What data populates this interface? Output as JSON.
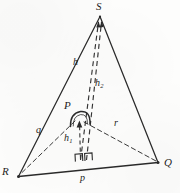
{
  "figure": {
    "stroke_color": "#2b2b2b",
    "dash_color": "#3a3a3a",
    "background_color": "#fdfdfc"
  },
  "vertices": [
    {
      "id": "S",
      "label": "S",
      "x": 100,
      "y": 16,
      "label_x": 98,
      "label_y": 2
    },
    {
      "id": "R",
      "label": "R",
      "x": 18,
      "y": 176,
      "label_x": 4,
      "label_y": 168
    },
    {
      "id": "Q",
      "label": "Q",
      "x": 158,
      "y": 162,
      "label_x": 164,
      "label_y": 160
    },
    {
      "id": "P",
      "label": "P",
      "x": 78,
      "y": 119,
      "label_x": 66,
      "label_y": 101
    }
  ],
  "sides": [
    {
      "id": "RS",
      "from": "R",
      "to": "S",
      "style": "solid"
    },
    {
      "id": "SQ",
      "from": "S",
      "to": "Q",
      "style": "solid"
    },
    {
      "id": "RQ",
      "from": "R",
      "to": "Q",
      "style": "solid"
    }
  ],
  "segments": [
    {
      "id": "q",
      "label": "q",
      "from": "P",
      "to": "R",
      "style": "dashed",
      "label_x": 38,
      "label_y": 131
    },
    {
      "id": "r",
      "label": "r",
      "from": "P",
      "to": "Q",
      "style": "dashed",
      "label_x": 115,
      "label_y": 124
    },
    {
      "id": "h",
      "label": "h",
      "sub": "",
      "from": "foot-base",
      "to": "S",
      "style": "dashed",
      "label_x": 84,
      "label_y": 63
    },
    {
      "id": "h2",
      "label": "h",
      "sub": "2",
      "from": "P",
      "to": "S",
      "style": "dashed",
      "label_x": 98,
      "label_y": 84
    },
    {
      "id": "h1",
      "label": "h",
      "sub": "1",
      "from": "P",
      "to": "foot-base",
      "style": "dashed-arrow",
      "label_x": 69,
      "label_y": 139
    },
    {
      "id": "p",
      "label": "p",
      "from": "R",
      "to": "Q",
      "style": "solid",
      "label_x": 82,
      "label_y": 179
    }
  ],
  "marks": [
    {
      "id": "right-angle-base-left",
      "type": "right-angle-square",
      "x": 76,
      "y": 160
    },
    {
      "id": "right-angle-base-right",
      "type": "right-angle-square",
      "x": 87,
      "y": 159
    },
    {
      "id": "angle-arc-at-P",
      "type": "arc",
      "x": 78,
      "y": 119
    }
  ],
  "labels": {
    "S": "S",
    "R": "R",
    "Q": "Q",
    "P": "P",
    "p": "p",
    "q": "q",
    "r": "r",
    "h": "h",
    "h1": "h",
    "h1_sub": "1",
    "h2": "h",
    "h2_sub": "2"
  }
}
